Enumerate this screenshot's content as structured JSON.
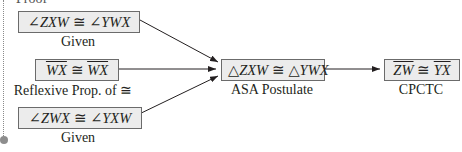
{
  "header": {
    "cut_text": "Proof"
  },
  "statements": [
    {
      "id": "s1",
      "parts": [
        {
          "t": "∠",
          "n": 1
        },
        {
          "t": "ZXW"
        },
        {
          "t": " ≅ ",
          "n": 1
        },
        {
          "t": "∠",
          "n": 1
        },
        {
          "t": "YWX"
        }
      ],
      "reason": "Given"
    },
    {
      "id": "s2",
      "parts": [
        {
          "t": "WX",
          "o": 1
        },
        {
          "t": " ≅ ",
          "n": 1
        },
        {
          "t": "WX",
          "o": 1
        }
      ],
      "reason": "Reflexive Prop. of ≅"
    },
    {
      "id": "s3",
      "parts": [
        {
          "t": "∠",
          "n": 1
        },
        {
          "t": "ZWX"
        },
        {
          "t": " ≅ ",
          "n": 1
        },
        {
          "t": "∠",
          "n": 1
        },
        {
          "t": "YXW"
        }
      ],
      "reason": "Given"
    },
    {
      "id": "s4",
      "parts": [
        {
          "t": "△",
          "n": 1
        },
        {
          "t": "ZXW"
        },
        {
          "t": " ≅ ",
          "n": 1
        },
        {
          "t": "△",
          "n": 1
        },
        {
          "t": "YWX"
        }
      ],
      "reason": "ASA Postulate"
    },
    {
      "id": "s5",
      "parts": [
        {
          "t": "ZW",
          "o": 1
        },
        {
          "t": " ≅ ",
          "n": 1
        },
        {
          "t": "YX",
          "o": 1
        }
      ],
      "reason": "CPCTC"
    }
  ],
  "flow": [
    [
      "s1",
      "s4"
    ],
    [
      "s2",
      "s4"
    ],
    [
      "s3",
      "s4"
    ],
    [
      "s4",
      "s5"
    ]
  ],
  "colors": {
    "box_fill": "#ececec",
    "box_border": "#6b6b6b",
    "text": "#231f20",
    "arrow": "#231f20"
  }
}
